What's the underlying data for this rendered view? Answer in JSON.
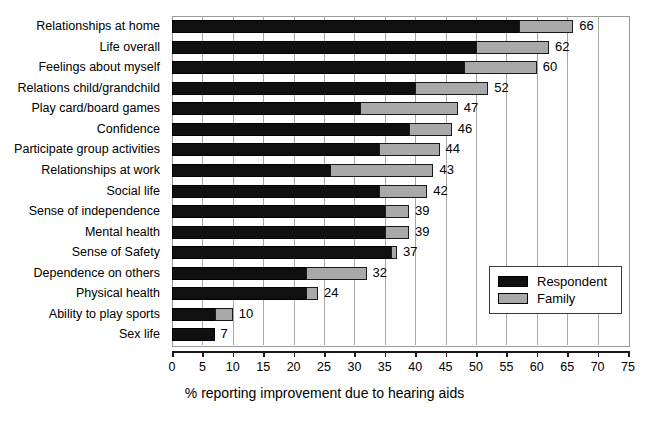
{
  "chart_data": {
    "type": "bar",
    "orientation": "horizontal",
    "stacked": true,
    "title": "",
    "xlabel": "% reporting improvement due to hearing aids",
    "ylabel": "",
    "xlim": [
      0,
      75
    ],
    "xticks": [
      0,
      5,
      10,
      15,
      20,
      25,
      30,
      35,
      40,
      45,
      50,
      55,
      60,
      65,
      70,
      75
    ],
    "grid": true,
    "grid_axis": "x",
    "legend_position": "bottom-right",
    "categories": [
      "Relationships at home",
      "Life overall",
      "Feelings about myself",
      "Relations child/grandchild",
      "Play card/board games",
      "Confidence",
      "Participate group activities",
      "Relationships at work",
      "Social life",
      "Sense of independence",
      "Mental health",
      "Sense of Safety",
      "Dependence on others",
      "Physical health",
      "Ability to play sports",
      "Sex life"
    ],
    "series": [
      {
        "name": "Respondent",
        "color": "#101010",
        "values": [
          57,
          50,
          48,
          40,
          31,
          39,
          34,
          26,
          34,
          35,
          35,
          36,
          22,
          22,
          7,
          7
        ]
      },
      {
        "name": "Family",
        "color": "#a9a9a9",
        "values": [
          9,
          12,
          12,
          12,
          16,
          7,
          10,
          17,
          8,
          4,
          4,
          1,
          10,
          2,
          3,
          0
        ]
      }
    ],
    "totals": [
      66,
      62,
      60,
      52,
      47,
      46,
      44,
      43,
      42,
      39,
      39,
      37,
      32,
      24,
      10,
      7
    ],
    "total_labels": [
      "66",
      "62",
      "60",
      "52",
      "47",
      "46",
      "44",
      "43",
      "42",
      "39",
      "39",
      "37",
      "32",
      "24",
      "10",
      "7"
    ]
  },
  "legend": {
    "items": [
      {
        "label": "Respondent",
        "color": "#101010"
      },
      {
        "label": "Family",
        "color": "#a9a9a9"
      }
    ]
  }
}
